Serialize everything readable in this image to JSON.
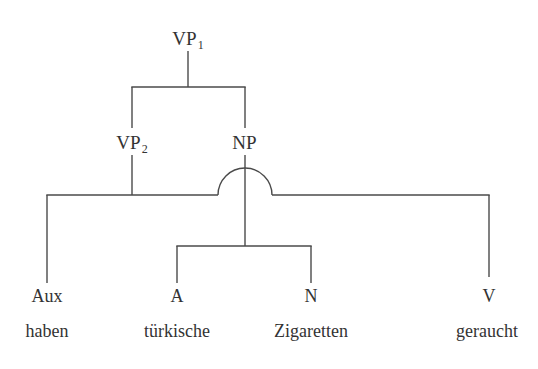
{
  "diagram": {
    "type": "syntax-tree",
    "title": "",
    "language": "German",
    "sentence": "haben türkische Zigaretten geraucht",
    "background_color": "#ffffff",
    "line_color": "#4a4a4a",
    "text_color": "#333333",
    "nodes": {
      "vp1": {
        "label": "VP",
        "subscript": "1",
        "x": 188,
        "y": 38
      },
      "vp2": {
        "label": "VP",
        "subscript": "2",
        "x": 132,
        "y": 142
      },
      "np": {
        "label": "NP",
        "subscript": "",
        "x": 245,
        "y": 142
      }
    },
    "terminals": [
      {
        "category": "Aux",
        "word": "haben",
        "x": 47
      },
      {
        "category": "A",
        "word": "türkische",
        "x": 177
      },
      {
        "category": "N",
        "word": "Zigaretten",
        "x": 311
      },
      {
        "category": "V",
        "word": "geraucht",
        "x": 489
      }
    ],
    "rows": {
      "category_y": 296,
      "word_y": 331
    },
    "edges": {
      "vp1_stem": {
        "x": 188,
        "y1": 51,
        "y2": 87
      },
      "vp1_bar": {
        "y": 87,
        "x1": 132,
        "x2": 245
      },
      "vp1_left_drop": {
        "x": 132,
        "y1": 87,
        "y2": 128
      },
      "vp1_right_drop": {
        "x": 245,
        "y1": 87,
        "y2": 128
      },
      "vp2_stem": {
        "x": 132,
        "y1": 155,
        "y2": 195
      },
      "np_stem": {
        "x": 245,
        "y1": 155,
        "y2": 246
      },
      "main_bar_left": {
        "y": 195,
        "x1": 47,
        "x2": 218
      },
      "main_bar_right": {
        "y": 195,
        "x1": 272,
        "x2": 489
      },
      "crossing_arc": {
        "cx": 245,
        "cy": 195,
        "r": 27
      },
      "aux_drop": {
        "x": 47,
        "y1": 195,
        "y2": 283
      },
      "v_drop": {
        "x": 489,
        "y1": 195,
        "y2": 277
      },
      "np_bar": {
        "y": 246,
        "x1": 177,
        "x2": 311
      },
      "a_drop": {
        "x": 177,
        "y1": 246,
        "y2": 283
      },
      "n_drop": {
        "x": 311,
        "y1": 246,
        "y2": 283
      }
    }
  }
}
